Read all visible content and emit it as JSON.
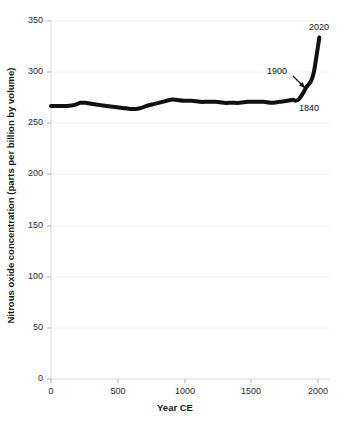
{
  "chart_data": {
    "type": "line",
    "title": "",
    "xlabel": "Year CE",
    "ylabel": "Nitrous oxide concentration (parts per billion by volume)",
    "xlim": [
      0,
      2100
    ],
    "ylim": [
      0,
      350
    ],
    "xticks": [
      0,
      500,
      1000,
      1500,
      2000
    ],
    "xtick_labels": [
      "0",
      "500",
      "1000",
      "1500",
      "2000"
    ],
    "yticks": [
      0,
      50,
      100,
      150,
      200,
      250,
      300,
      350
    ],
    "ytick_labels": [
      "0",
      "50",
      "100",
      "150",
      "200",
      "250",
      "300",
      "350"
    ],
    "grid": false,
    "legend": "none",
    "line_color": "#111111",
    "line_width_px": 4,
    "series": [
      {
        "name": "Nitrous oxide concentration",
        "x": [
          0,
          60,
          120,
          180,
          220,
          260,
          300,
          360,
          420,
          480,
          540,
          600,
          640,
          680,
          720,
          780,
          840,
          900,
          940,
          1000,
          1060,
          1120,
          1180,
          1240,
          1300,
          1360,
          1420,
          1480,
          1540,
          1600,
          1660,
          1720,
          1780,
          1820,
          1840,
          1860,
          1880,
          1900,
          1920,
          1940,
          1960,
          1980,
          2000,
          2020
        ],
        "y": [
          267,
          267,
          267,
          268,
          270,
          270,
          269,
          268,
          267,
          266,
          265,
          264,
          264,
          265,
          267,
          269,
          271,
          273,
          273,
          272,
          272,
          271,
          271,
          271,
          270,
          270,
          270,
          271,
          271,
          271,
          270,
          271,
          272,
          273,
          272,
          273,
          276,
          280,
          285,
          288,
          292,
          301,
          317,
          334
        ]
      }
    ],
    "annotations": [
      {
        "text": "2020",
        "x_px": 320,
        "y_px": 28,
        "points_to": "line-end"
      },
      {
        "text": "1900",
        "x_px": 283,
        "y_px": 72,
        "points_to": "line-1900"
      },
      {
        "text": "1840",
        "x_px": 313,
        "y_px": 110,
        "points_to": "line-1840"
      }
    ],
    "arrow": {
      "from_x_px": 293,
      "from_y_px": 76,
      "to_x_px": 305,
      "to_y_px": 88
    }
  },
  "axes": {
    "x_origin_px": 51,
    "x_end_px": 330,
    "y_top_px": 21,
    "y_bottom_px": 379
  }
}
